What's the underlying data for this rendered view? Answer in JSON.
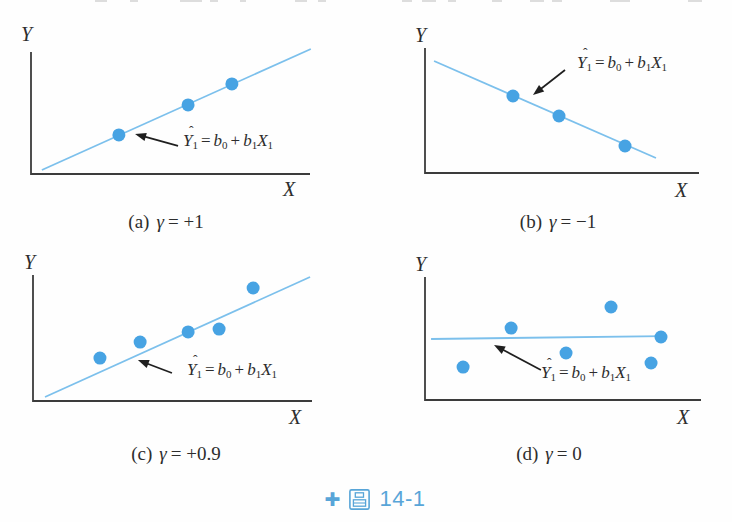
{
  "figure": {
    "caption": {
      "icon_glyph": "✚",
      "label": "圖",
      "number": "14-1"
    }
  },
  "formula": {
    "hat": "ˆ",
    "lhs_base": "Y",
    "lhs_sub": "1",
    "equals": "=",
    "term1_base": "b",
    "term1_sub": "0",
    "plus": "+",
    "term2_base": "b",
    "term2_sub": "1",
    "term3_base": "X",
    "term3_sub": "1"
  },
  "colors": {
    "regression_line": "#7cc0ec",
    "data_point": "#47a3e3",
    "axis": "#3c3c3c",
    "annotation_arrow": "#1f1f1f",
    "text": "#2d2d2d",
    "caption_accent": "#58a5d8"
  },
  "chart_data": [
    {
      "panel": "a",
      "type": "scatter",
      "caption": {
        "tag": "(a)",
        "symbol": "γ",
        "value": "= +1"
      },
      "xlabel": "X",
      "ylabel": "Y",
      "xlim": [
        0,
        1
      ],
      "ylim": [
        0,
        1
      ],
      "ticks": "none",
      "grid": false,
      "points": [
        [
          0.315,
          0.32
        ],
        [
          0.563,
          0.566
        ],
        [
          0.72,
          0.738
        ]
      ],
      "regression_line": {
        "x1": 0.039,
        "y1": 0.033,
        "x2": 1.003,
        "y2": 1.025
      },
      "annotation": {
        "text": "Ŷ₁ = b₀ + b₁X₁",
        "arrow_from": [
          0.527,
          0.23
        ],
        "arrow_to": [
          0.373,
          0.328
        ]
      }
    },
    {
      "panel": "b",
      "type": "scatter",
      "caption": {
        "tag": "(b)",
        "symbol": "γ",
        "value": "= −1"
      },
      "xlabel": "X",
      "ylabel": "Y",
      "xlim": [
        0,
        1
      ],
      "ylim": [
        0,
        1
      ],
      "ticks": "none",
      "grid": false,
      "points": [
        [
          0.321,
          0.616
        ],
        [
          0.489,
          0.456
        ],
        [
          0.73,
          0.216
        ]
      ],
      "regression_line": {
        "x1": 0.033,
        "y1": 0.896,
        "x2": 0.843,
        "y2": 0.12
      },
      "annotation": {
        "text": "Ŷ₁ = b₀ + b₁X₁",
        "arrow_from": [
          0.511,
          0.824
        ],
        "arrow_to": [
          0.394,
          0.624
        ]
      }
    },
    {
      "panel": "c",
      "type": "scatter",
      "caption": {
        "tag": "(c)",
        "symbol": "γ",
        "value": "= +0.9"
      },
      "xlabel": "X",
      "ylabel": "Y",
      "xlim": [
        0,
        1
      ],
      "ylim": [
        0,
        1
      ],
      "ticks": "none",
      "grid": false,
      "points": [
        [
          0.24,
          0.341
        ],
        [
          0.384,
          0.468
        ],
        [
          0.556,
          0.548
        ],
        [
          0.667,
          0.571
        ],
        [
          0.789,
          0.897
        ]
      ],
      "regression_line": {
        "x1": 0.043,
        "y1": 0.032,
        "x2": 0.993,
        "y2": 0.984
      },
      "annotation": {
        "text": "Ŷ₁ = b₀ + b₁X₁",
        "arrow_from": [
          0.498,
          0.222
        ],
        "arrow_to": [
          0.376,
          0.325
        ]
      }
    },
    {
      "panel": "d",
      "type": "scatter",
      "caption": {
        "tag": "(d)",
        "symbol": "γ",
        "value": "= 0"
      },
      "xlabel": "X",
      "ylabel": "Y",
      "xlim": [
        0,
        1
      ],
      "ylim": [
        0,
        1
      ],
      "ticks": "none",
      "grid": false,
      "points": [
        [
          0.138,
          0.268
        ],
        [
          0.312,
          0.585
        ],
        [
          0.511,
          0.382
        ],
        [
          0.674,
          0.756
        ],
        [
          0.819,
          0.301
        ],
        [
          0.855,
          0.512
        ]
      ],
      "regression_line": {
        "x1": 0.022,
        "y1": 0.496,
        "x2": 0.862,
        "y2": 0.52
      },
      "annotation": {
        "text": "Ŷ₁ = b₀ + b₁X₁",
        "arrow_from": [
          0.42,
          0.244
        ],
        "arrow_to": [
          0.25,
          0.447
        ]
      }
    }
  ]
}
